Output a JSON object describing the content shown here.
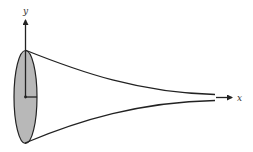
{
  "diagram": {
    "axes": {
      "x_label": "x",
      "y_label": "y"
    },
    "colors": {
      "stroke": "#222222",
      "disk_fill": "#b8b8b8",
      "background": "#ffffff"
    }
  }
}
